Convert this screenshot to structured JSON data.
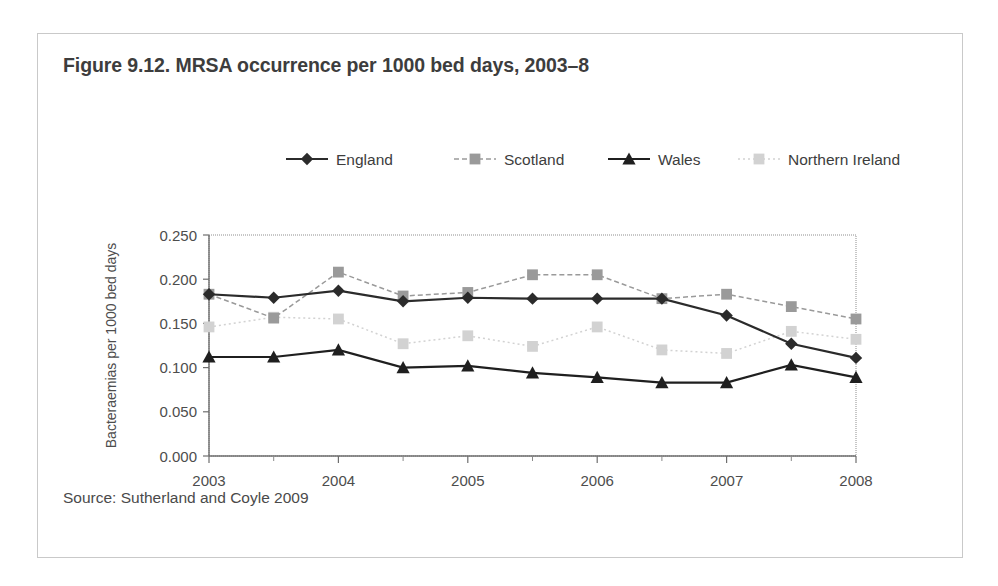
{
  "figure": {
    "title": "Figure 9.12. MRSA occurrence per 1000 bed days, 2003–8",
    "source": "Source: Sutherland and Coyle 2009"
  },
  "chart_data": {
    "type": "line",
    "title": "Figure 9.12. MRSA occurrence per 1000 bed days, 2003–8",
    "xlabel": "Years",
    "ylabel": "Bacteraemias per 1000 bed days",
    "xlim": [
      2003,
      2008
    ],
    "ylim": [
      0.0,
      0.25
    ],
    "grid": false,
    "legend_position": "top",
    "x_tick_labels": [
      "2003",
      "2004",
      "2005",
      "2006",
      "2007",
      "2008"
    ],
    "x_ticks": [
      2003,
      2004,
      2005,
      2006,
      2007,
      2008
    ],
    "x_minor_ticks": [
      2003.5,
      2004.5,
      2005.5,
      2006.5,
      2007.5
    ],
    "y_tick_labels": [
      "0.000",
      "0.050",
      "0.100",
      "0.150",
      "0.200",
      "0.250"
    ],
    "y_ticks": [
      0.0,
      0.05,
      0.1,
      0.15,
      0.2,
      0.25
    ],
    "x": [
      2003,
      2003.5,
      2004,
      2004.5,
      2005,
      2005.5,
      2006,
      2006.5,
      2007,
      2007.5,
      2008
    ],
    "series": [
      {
        "name": "England",
        "marker": "diamond",
        "color": "#2b2b2b",
        "line_style": "solid",
        "values": [
          0.183,
          0.179,
          0.187,
          0.175,
          0.179,
          0.178,
          0.178,
          0.178,
          0.159,
          0.127,
          0.111
        ]
      },
      {
        "name": "Scotland",
        "marker": "square",
        "color": "#9a9a9a",
        "line_style": "dashed",
        "values": [
          0.183,
          0.156,
          0.208,
          0.181,
          0.185,
          0.205,
          0.205,
          0.178,
          0.183,
          0.169,
          0.155
        ]
      },
      {
        "name": "Wales",
        "marker": "triangle",
        "color": "#1f1f1f",
        "line_style": "solid",
        "values": [
          0.112,
          0.112,
          0.12,
          0.1,
          0.102,
          0.094,
          0.089,
          0.083,
          0.083,
          0.103,
          0.089
        ]
      },
      {
        "name": "Northern Ireland",
        "marker": "square",
        "color": "#d2d2d2",
        "line_style": "dotted",
        "values": [
          0.146,
          0.157,
          0.155,
          0.127,
          0.136,
          0.124,
          0.146,
          0.12,
          0.116,
          0.141,
          0.132
        ]
      }
    ]
  }
}
